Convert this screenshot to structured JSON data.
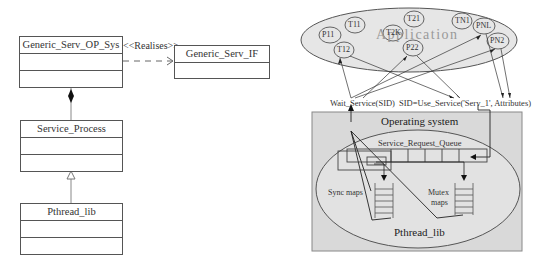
{
  "uml": {
    "classes": [
      {
        "name": "Generic_Serv_OP_Sys"
      },
      {
        "name": "Generic_Serv_IF"
      },
      {
        "name": "Service_Process"
      },
      {
        "name": "Pthread_lib"
      }
    ],
    "realises_label": "<<Realises>>"
  },
  "system": {
    "application_label": "Application",
    "threads": [
      "T11",
      "P11",
      "T12",
      "T21",
      "T2K",
      "P22",
      "TN1",
      "PNL",
      "PN2"
    ],
    "wait_call": "Wait_Service(SID)",
    "use_call": "SID=Use_Service('Serv_1', Attributes)",
    "os_label": "Operating system",
    "queue_label": "Service_Request_Queue",
    "sync_maps_label": "Sync maps",
    "mutex_maps_label_1": "Mutex",
    "mutex_maps_label_2": "maps",
    "pthread_label": "Pthread_lib"
  },
  "colors": {
    "app_fill": "#e6e6e6",
    "os_fill": "#d9d9d9",
    "inner_fill": "#e2e2e2",
    "line": "#444444"
  }
}
